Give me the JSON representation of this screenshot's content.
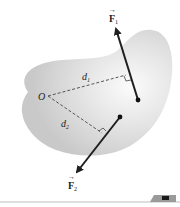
{
  "diagram": {
    "point_label": "O",
    "distance_1": "d",
    "distance_1_sub": "1",
    "distance_2": "d",
    "distance_2_sub": "2",
    "force_1": "F",
    "force_1_sub": "1",
    "force_2": "F",
    "force_2_sub": "2",
    "arrow_symbol": "→",
    "colors": {
      "body_fill": "#d6d6d6",
      "body_highlight": "#f4f4f4",
      "arrow": "#1f1f1f",
      "dashed": "#444444",
      "footer_line": "#bdbdbd",
      "tab": "#9a9a9a"
    }
  }
}
